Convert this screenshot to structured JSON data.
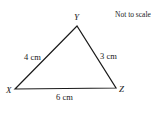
{
  "diagram": {
    "note": "Not to scale",
    "vertices": [
      {
        "name": "X",
        "x": 15,
        "y": 89
      },
      {
        "name": "Y",
        "x": 77,
        "y": 26
      },
      {
        "name": "Z",
        "x": 116,
        "y": 88
      }
    ],
    "sides": [
      {
        "from": "X",
        "to": "Y",
        "label": "4 cm"
      },
      {
        "from": "Y",
        "to": "Z",
        "label": "3 cm"
      },
      {
        "from": "X",
        "to": "Z",
        "label": "6 cm"
      }
    ],
    "stroke_color": "#1a1a1a"
  }
}
